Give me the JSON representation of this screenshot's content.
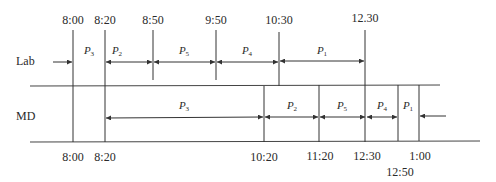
{
  "rows": {
    "lab": {
      "label": "Lab"
    },
    "md": {
      "label": "MD"
    }
  },
  "lab_times": [
    {
      "label": "8:00",
      "x": 73
    },
    {
      "label": "8:20",
      "x": 105
    },
    {
      "label": "8:50",
      "x": 153
    },
    {
      "label": "9:50",
      "x": 216
    },
    {
      "label": "10:30",
      "x": 279
    },
    {
      "label": "12.30",
      "x": 365
    }
  ],
  "lab_segments": [
    {
      "name": "P",
      "sub": "3",
      "x": 89
    },
    {
      "name": "P",
      "sub": "2",
      "x": 117
    },
    {
      "name": "P",
      "sub": "5",
      "x": 184
    },
    {
      "name": "P",
      "sub": "4",
      "x": 247
    },
    {
      "name": "P",
      "sub": "1",
      "x": 322
    }
  ],
  "md_times": [
    {
      "label": "8:00",
      "x": 73
    },
    {
      "label": "8:20",
      "x": 105
    },
    {
      "label": "10:20",
      "x": 264
    },
    {
      "label": "11:20",
      "x": 319
    },
    {
      "label": "12:30",
      "x": 366
    },
    {
      "label": "12:50",
      "x": 398
    },
    {
      "label": "1:00",
      "x": 419
    }
  ],
  "md_segments": [
    {
      "name": "P",
      "sub": "3",
      "x": 184
    },
    {
      "name": "P",
      "sub": "2",
      "x": 292
    },
    {
      "name": "P",
      "sub": "5",
      "x": 342
    },
    {
      "name": "P",
      "sub": "4",
      "x": 382
    },
    {
      "name": "P",
      "sub": "1",
      "x": 408
    }
  ]
}
